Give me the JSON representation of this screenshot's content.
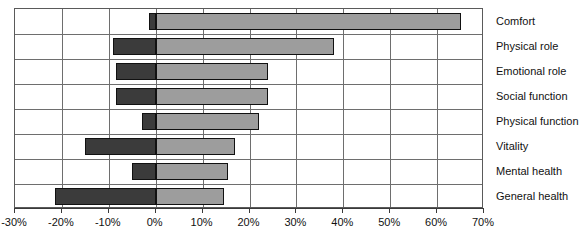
{
  "chart_data": {
    "type": "bar",
    "title": "",
    "subtitle": "",
    "xlabel": "",
    "ylabel": "",
    "orientation": "horizontal",
    "grid": true,
    "legend": "none",
    "xlim": [
      -30,
      70
    ],
    "xtick_labels": [
      "-30%",
      "-20%",
      "-10%",
      "0%",
      "10%",
      "20%",
      "30%",
      "40%",
      "50%",
      "60%",
      "70%"
    ],
    "xticks": [
      -30,
      -20,
      -10,
      0,
      10,
      20,
      30,
      40,
      50,
      60,
      70
    ],
    "categories": [
      "Comfort",
      "Physical role",
      "Emotional role",
      "Social function",
      "Physical function",
      "Vitality",
      "Mental health",
      "General health"
    ],
    "series": [
      {
        "name": "negative",
        "color": "#3b3b3b",
        "values": [
          -1.5,
          -9.0,
          -8.5,
          -8.5,
          -3.0,
          -15.0,
          -5.0,
          -21.5
        ]
      },
      {
        "name": "positive",
        "color": "#9d9d9d",
        "values": [
          65.0,
          38.0,
          24.0,
          24.0,
          22.0,
          17.0,
          15.5,
          14.5
        ]
      }
    ]
  }
}
